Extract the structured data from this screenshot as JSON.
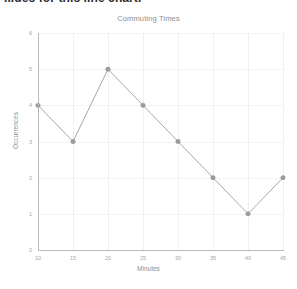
{
  "page": {
    "heading_partial": "...ues for this line chart."
  },
  "chart_data": {
    "type": "line",
    "title": "Commuting Times",
    "xlabel": "Minutes",
    "ylabel": "Occurrences",
    "x": [
      10,
      15,
      20,
      25,
      30,
      35,
      40,
      45
    ],
    "values": [
      4,
      3,
      5,
      4,
      3,
      2,
      1,
      2
    ],
    "xticks": [
      "10",
      "15",
      "20",
      "25",
      "30",
      "35",
      "40",
      "45"
    ],
    "yticks": [
      "0",
      "1",
      "2",
      "3",
      "4",
      "5",
      "6"
    ],
    "xlim": [
      10,
      45
    ],
    "ylim": [
      0,
      6
    ],
    "grid": true,
    "legend": null,
    "marker": "circle",
    "line_color": "#a8a8a8",
    "marker_color": "#9b9b9b",
    "grid_color": "#f0f0f2",
    "axis_color": "#b9b9b9",
    "text_color": "#9a9a9a"
  }
}
